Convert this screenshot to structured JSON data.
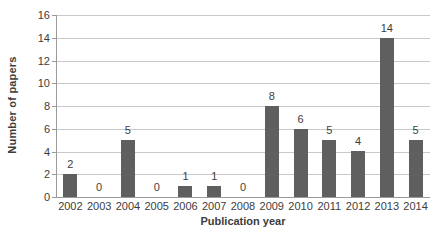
{
  "chart_data": {
    "type": "bar",
    "categories": [
      "2002",
      "2003",
      "2004",
      "2005",
      "2006",
      "2007",
      "2008",
      "2009",
      "2010",
      "2011",
      "2012",
      "2013",
      "2014"
    ],
    "values": [
      2,
      0,
      5,
      0,
      1,
      1,
      0,
      8,
      6,
      5,
      4,
      14,
      5
    ],
    "title": "",
    "xlabel": "Publication year",
    "ylabel": "Number of papers",
    "ylim": [
      0,
      16
    ],
    "ytick_step": 2,
    "yticks": [
      "0",
      "2",
      "4",
      "6",
      "8",
      "10",
      "12",
      "14",
      "16"
    ],
    "grid": true,
    "legend": "none",
    "bar_color": "#5f5f5f",
    "gridline_color": "#c9c9c9",
    "axis_color": "#9a9a9a",
    "text_color": "#3d3d3d"
  }
}
